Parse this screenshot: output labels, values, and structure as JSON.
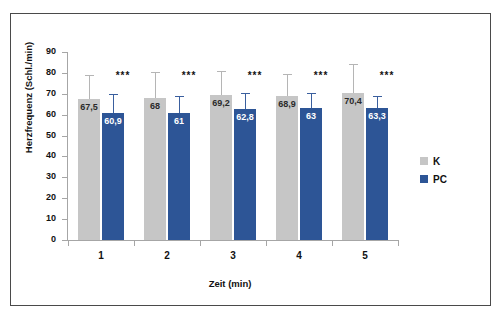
{
  "chart_data": {
    "type": "bar",
    "title": "",
    "xlabel": "Zeit (min)",
    "ylabel": "Herzfrequenz (Schl./min)",
    "categories": [
      "1",
      "2",
      "3",
      "4",
      "5"
    ],
    "ylim": [
      0,
      90
    ],
    "y_ticks": [
      "0",
      "10",
      "20",
      "30",
      "40",
      "50",
      "60",
      "70",
      "80",
      "90"
    ],
    "grid": false,
    "legend_position": "right",
    "series": [
      {
        "name": "K",
        "color": "#c6c6c6",
        "values": [
          67.5,
          68,
          69.2,
          68.9,
          70.4
        ],
        "labels": [
          "67,5",
          "68",
          "69,2",
          "68,9",
          "70,4"
        ],
        "errors_upper": [
          11.5,
          12.5,
          11.5,
          10.5,
          14.0
        ]
      },
      {
        "name": "PC",
        "color": "#2d5596",
        "values": [
          60.9,
          61,
          62.8,
          63,
          63.3
        ],
        "labels": [
          "60,9",
          "61",
          "62,8",
          "63",
          "63,3"
        ],
        "errors_upper": [
          9.1,
          8.0,
          7.7,
          7.5,
          5.7
        ]
      }
    ],
    "annotations": [
      {
        "category": "1",
        "text": "***"
      },
      {
        "category": "2",
        "text": "***"
      },
      {
        "category": "3",
        "text": "***"
      },
      {
        "category": "4",
        "text": "***"
      },
      {
        "category": "5",
        "text": "***"
      }
    ]
  },
  "legend": {
    "items": [
      {
        "label": "K",
        "color": "#c6c6c6"
      },
      {
        "label": "PC",
        "color": "#2d5596"
      }
    ]
  }
}
